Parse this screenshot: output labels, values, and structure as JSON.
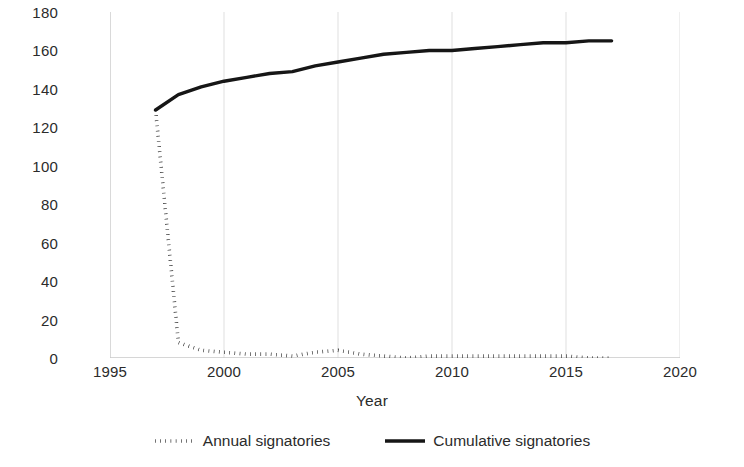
{
  "chart_data": {
    "type": "line",
    "title": "",
    "xlabel": "Year",
    "ylabel": "Annual/Cumulative Signtory States",
    "xlim": [
      1995,
      2020
    ],
    "ylim": [
      0,
      180
    ],
    "xticks": [
      1995,
      2000,
      2005,
      2010,
      2015,
      2020
    ],
    "yticks": [
      0,
      20,
      40,
      60,
      80,
      100,
      120,
      140,
      160,
      180
    ],
    "grid": "vertical",
    "legend_position": "bottom",
    "x": [
      1997,
      1998,
      1999,
      2000,
      2001,
      2002,
      2003,
      2004,
      2005,
      2006,
      2007,
      2008,
      2009,
      2010,
      2011,
      2012,
      2013,
      2014,
      2015,
      2016,
      2017
    ],
    "series": [
      {
        "name": "Annual signatories",
        "style": "dotted",
        "color": "#161616",
        "values": [
          129,
          8,
          4,
          3,
          2,
          2,
          1,
          3,
          4,
          2,
          1,
          0,
          1,
          1,
          1,
          1,
          1,
          1,
          1,
          0,
          0
        ]
      },
      {
        "name": "Cumulative signatories",
        "style": "solid",
        "color": "#161616",
        "values": [
          129,
          137,
          141,
          144,
          146,
          148,
          149,
          152,
          154,
          156,
          158,
          159,
          160,
          160,
          161,
          162,
          163,
          164,
          164,
          165,
          165
        ]
      }
    ]
  },
  "axis": {
    "y_ticks": [
      "0",
      "20",
      "40",
      "60",
      "80",
      "100",
      "120",
      "140",
      "160",
      "180"
    ],
    "x_ticks": [
      "1995",
      "2000",
      "2005",
      "2010",
      "2015",
      "2020"
    ],
    "y_title": "Annual/Cumulative Signtory\nStates",
    "x_title": "Year"
  },
  "legend": {
    "items": [
      {
        "label": "Annual signatories",
        "style": "dotted"
      },
      {
        "label": "Cumulative signatories",
        "style": "solid"
      }
    ]
  },
  "colors": {
    "line": "#161616",
    "grid": "#e4e4e4",
    "axis": "#c9c9c9",
    "text": "#2b2b2b"
  }
}
